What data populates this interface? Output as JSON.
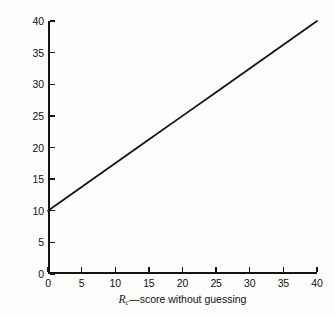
{
  "figure": {
    "background_color": "#fdfdfb",
    "ink_color": "#141414"
  },
  "chart_data": {
    "type": "line",
    "title": "",
    "xlabel": "R_c—score without guessing",
    "ylabel": "R—expected score with guessing",
    "xlabel_parts": {
      "symbol": "R",
      "subscript": "c",
      "text": "—score without guessing"
    },
    "ylabel_parts": {
      "symbol": "R",
      "subscript": "",
      "text": "—expected score with guessing"
    },
    "xlim": [
      0,
      40
    ],
    "ylim": [
      0,
      40
    ],
    "xticks": [
      0,
      5,
      10,
      15,
      20,
      25,
      30,
      35,
      40
    ],
    "yticks": [
      0,
      5,
      10,
      15,
      20,
      25,
      30,
      35,
      40
    ],
    "xtick_labels": [
      "0",
      "5",
      "10",
      "15",
      "20",
      "25",
      "30",
      "35",
      "40"
    ],
    "ytick_labels": [
      "0",
      "5",
      "10",
      "15",
      "20",
      "25",
      "30",
      "35",
      "40"
    ],
    "grid": false,
    "legend": null,
    "tick_direction": "in",
    "spines": [
      "left",
      "bottom"
    ],
    "series": [
      {
        "name": "expected score with guessing",
        "color": "#141414",
        "line_width": 1.8,
        "equation": "R = 10 + 0.75 * Rc",
        "x": [
          0,
          5,
          10,
          15,
          20,
          25,
          30,
          35,
          40
        ],
        "values": [
          10,
          13.75,
          17.5,
          21.25,
          25,
          28.75,
          32.5,
          36.25,
          40
        ]
      }
    ]
  }
}
